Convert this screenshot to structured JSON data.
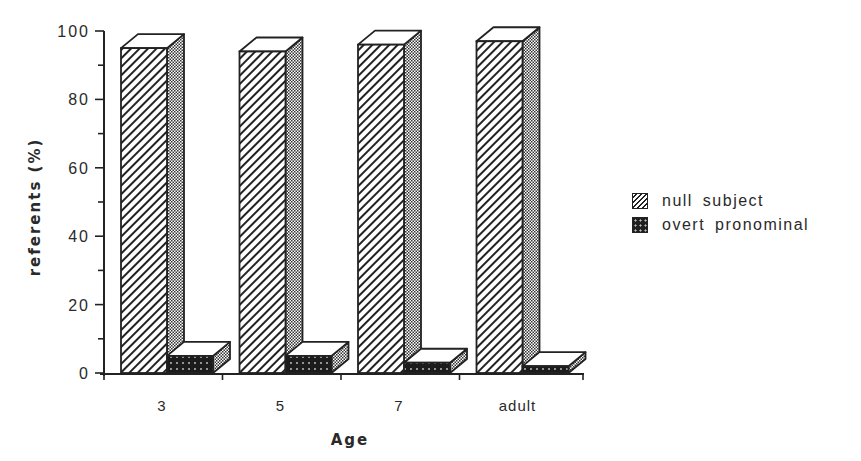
{
  "chart_data": {
    "type": "bar",
    "style": "3d-grouped",
    "title": "",
    "xlabel": "Age",
    "ylabel": "referents (%)",
    "categories": [
      "3",
      "5",
      "7",
      "adult"
    ],
    "series": [
      {
        "name": "null subject",
        "pattern": "diagonal-hatch",
        "values": [
          95,
          94,
          96,
          97
        ]
      },
      {
        "name": "overt pronominal",
        "pattern": "dark-dotted",
        "values": [
          5,
          5,
          3,
          2
        ]
      }
    ],
    "ylim": [
      0,
      100
    ],
    "yticks": [
      0,
      20,
      40,
      60,
      80,
      100
    ],
    "minor_ytick_step": 10,
    "grid": false,
    "legend_position": "right"
  },
  "axes": {
    "y_title": "referents (%)",
    "x_title": "Age",
    "y_tick_labels": [
      "0",
      "20",
      "40",
      "60",
      "80",
      "100"
    ],
    "x_tick_labels": [
      "3",
      "5",
      "7",
      "adult"
    ]
  },
  "legend": {
    "items": [
      {
        "label": "null subject"
      },
      {
        "label": "overt pronominal"
      }
    ]
  }
}
